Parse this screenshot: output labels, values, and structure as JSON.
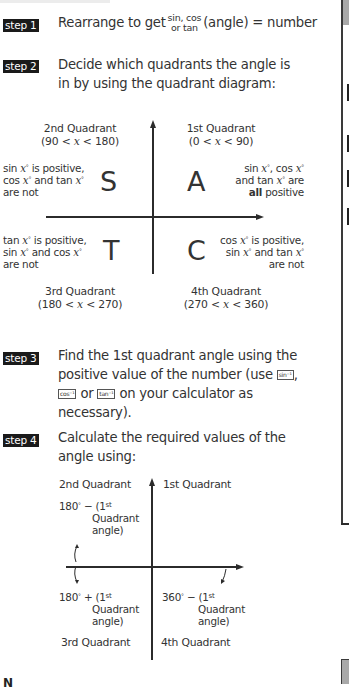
{
  "steps": [
    {
      "badge": "step 1",
      "text_before": "Rearrange to get",
      "fraction_top": "sin, cos",
      "fraction_bottom": "or tan",
      "text_after": "(angle) = number"
    },
    {
      "badge": "step 2",
      "line1": "Decide which quadrants the angle is",
      "line2": "in by using the quadrant diagram:"
    },
    {
      "badge": "step 3",
      "line1": "Find the 1st quadrant angle using the",
      "line2_before": "positive value of the number (use",
      "key_sin": "sin⁻¹",
      "line2_after": ",",
      "key_cos": "cos⁻¹",
      "line3_mid": "or",
      "key_tan": "tan⁻¹",
      "line3_after": "on your calculator as",
      "line4": "necessary)."
    },
    {
      "badge": "step 4",
      "line1": "Calculate the required values of the",
      "line2": "angle using:"
    }
  ],
  "cast_diagram": {
    "q2": {
      "title": "2nd  Quadrant",
      "range_a": "(90 <",
      "var": "x",
      "range_b": "< 180)",
      "letter": "S",
      "desc1_a": "sin",
      "desc1_b": "is positive,",
      "desc2_a": "cos",
      "desc2_b": "and tan",
      "desc3": "are not"
    },
    "q1": {
      "title": "1st  Quadrant",
      "range_a": "(0 <",
      "var": "x",
      "range_b": "< 90)",
      "letter": "A",
      "desc1_a": "sin",
      "desc1_b": ", cos",
      "desc2_a": "and tan",
      "desc2_b": "are",
      "desc3_bold": "all",
      "desc3_rest": "positive"
    },
    "q3": {
      "title": "3rd  Quadrant",
      "range_a": "(180 <",
      "var": "x",
      "range_b": "< 270)",
      "letter": "T",
      "desc1_a": "tan",
      "desc1_b": "is positive,",
      "desc2_a": "sin",
      "desc2_b": "and cos",
      "desc3": "are not"
    },
    "q4": {
      "title": "4th  Quadrant",
      "range_a": "(270 <",
      "var": "x",
      "range_b": "< 360)",
      "letter": "C",
      "desc1_a": "cos",
      "desc1_b": "is positive,",
      "desc2_a": "sin",
      "desc2_b": "and tan",
      "desc3": "are not"
    },
    "var_symbol": "x",
    "degree": "°"
  },
  "angle_diagram": {
    "q2_title": "2nd  Quadrant",
    "q1_title": "1st  Quadrant",
    "q3_title": "3rd  Quadrant",
    "q4_title": "4th  Quadrant",
    "q2_formula_a": "180",
    "q2_formula_b": " − (1",
    "q3_formula_a": "180",
    "q3_formula_b": " + (1",
    "q4_formula_a": "360",
    "q4_formula_b": " − (1",
    "sup_st": "st",
    "degree": "°",
    "quadrant_word": "Quadrant",
    "angle_word": "angle)"
  },
  "footer": {
    "note_partial": "N"
  }
}
